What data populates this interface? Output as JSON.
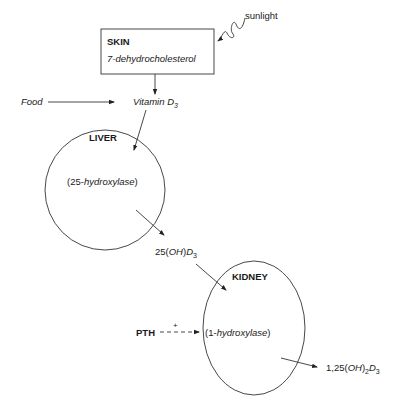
{
  "diagram": {
    "type": "vitamin-d-metabolism-flow",
    "colors": {
      "stroke": "#333333",
      "text": "#1a1a1a",
      "background": "#ffffff"
    },
    "skin": {
      "title": "SKIN",
      "substance": "7-dehydrocholesterol"
    },
    "sunlight": {
      "label": "sunlight"
    },
    "food": {
      "label": "Food"
    },
    "vitamin_d3": {
      "prefix": "Vitamin D",
      "sub": "3"
    },
    "liver": {
      "title": "LIVER",
      "enzyme_open": "(25-",
      "enzyme_name": "hydroxylase",
      "enzyme_close": ")"
    },
    "oh_d3": {
      "p1": "25(",
      "p2": "OH",
      "p3": ")",
      "p4": "D",
      "sub": "3"
    },
    "kidney": {
      "title": "KIDNEY",
      "enzyme_open": "(1-",
      "enzyme_name": "hydroxylase",
      "enzyme_close": ")"
    },
    "pth": {
      "label": "PTH",
      "effect": "+"
    },
    "product": {
      "p1": "1,25(",
      "p2": "OH",
      "p3": ")",
      "sub1": "2",
      "p4": "D",
      "sub2": "3"
    }
  }
}
